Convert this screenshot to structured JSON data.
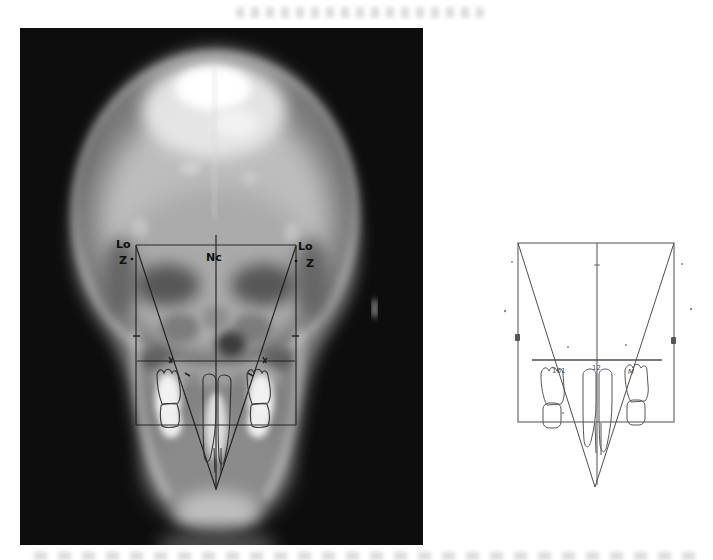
{
  "page": {
    "background": "#ffffff"
  },
  "radiograph_panel": {
    "background": "#0d0d0d",
    "tracing_color": "#161616",
    "labels": {
      "lo_left": "Lo",
      "z_left": "Z",
      "nc": "Nc",
      "lo_right": "Lo",
      "z_right": "Z"
    }
  },
  "tracing_panel": {
    "line_color": "#4e4e4e",
    "labels": {
      "left_molar": "101",
      "central_incisor": "12",
      "right_molar": "M"
    }
  }
}
